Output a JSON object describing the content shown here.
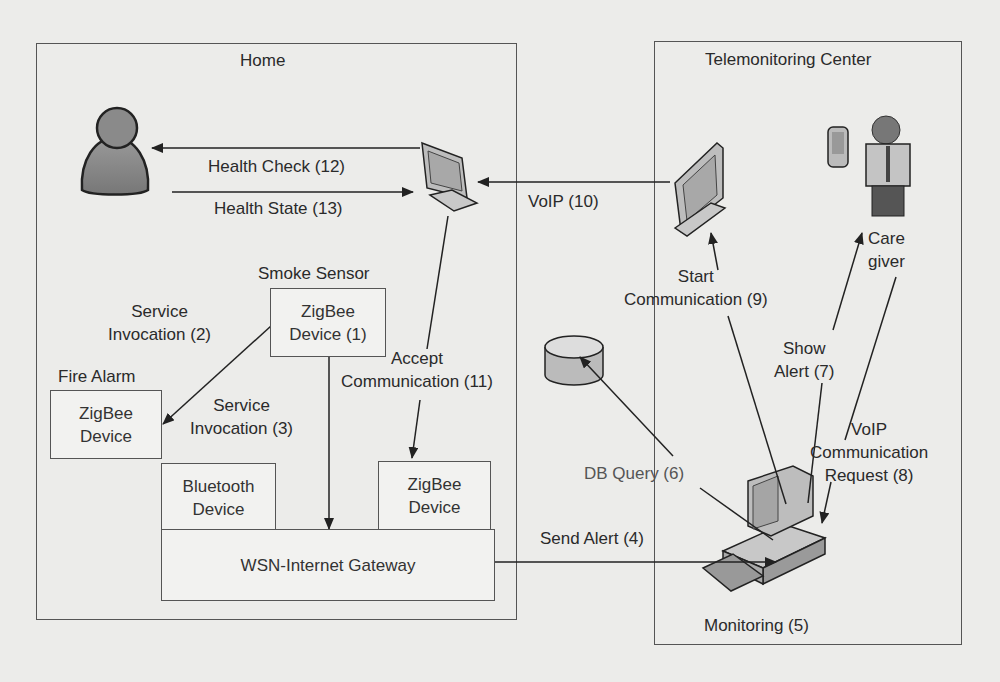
{
  "regions": {
    "home": {
      "title": "Home"
    },
    "telemonitoring": {
      "title": "Telemonitoring Center"
    }
  },
  "devices": {
    "smoke_sensor": {
      "caption": "Smoke Sensor",
      "line1": "ZigBee",
      "line2": "Device (1)"
    },
    "fire_alarm": {
      "caption": "Fire Alarm",
      "line1": "ZigBee",
      "line2": "Device"
    },
    "bluetooth": {
      "line1": "Bluetooth",
      "line2": "Device"
    },
    "zigbee_right": {
      "line1": "ZigBee",
      "line2": "Device"
    },
    "gateway": {
      "label": "WSN-Internet Gateway"
    }
  },
  "actors": {
    "caregiver": {
      "line1": "Care",
      "line2": "giver"
    },
    "monitoring": {
      "label": "Monitoring (5)"
    }
  },
  "messages": {
    "health_check": "Health Check (12)",
    "health_state": "Health State (13)",
    "voip": "VoIP (10)",
    "service_inv_2": {
      "line1": "Service",
      "line2": "Invocation (2)"
    },
    "service_inv_3": {
      "line1": "Service",
      "line2": "Invocation (3)"
    },
    "accept_comm": {
      "line1": "Accept",
      "line2": "Communication (11)"
    },
    "start_comm": {
      "line1": "Start",
      "line2": "Communication (9)"
    },
    "show_alert": {
      "line1": "Show",
      "line2": "Alert (7)"
    },
    "voip_request": {
      "line1": "VoIP",
      "line2": "Communication",
      "line3": "Request (8)"
    },
    "db_query": "DB Query (6)",
    "send_alert": "Send Alert (4)"
  },
  "colors": {
    "line": "#222222",
    "border": "#555555",
    "device_fill": "#c8c8c8",
    "background": "#ececea"
  }
}
